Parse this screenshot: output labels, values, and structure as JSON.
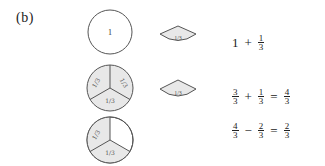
{
  "panel_label": "(b)",
  "rows": [
    {
      "circle": {
        "label": "1",
        "shaded_sectors": [],
        "sector_labels": []
      },
      "wedge": {
        "label": "1/3"
      },
      "equation": {
        "terms": [
          {
            "type": "int",
            "value": "1"
          },
          {
            "type": "op",
            "value": "+"
          },
          {
            "type": "frac",
            "num": "1",
            "den": "3"
          }
        ]
      }
    },
    {
      "circle": {
        "label": "",
        "shaded_sectors": [
          "left",
          "right",
          "bottom"
        ],
        "sector_labels": [
          "1/3",
          "1/3",
          "1/3"
        ]
      },
      "wedge": {
        "label": "1/3"
      },
      "equation": {
        "terms": [
          {
            "type": "frac",
            "num": "3",
            "den": "3"
          },
          {
            "type": "op",
            "value": "+"
          },
          {
            "type": "frac",
            "num": "1",
            "den": "3"
          },
          {
            "type": "op",
            "value": "="
          },
          {
            "type": "frac",
            "num": "4",
            "den": "3"
          }
        ]
      }
    },
    {
      "circle": {
        "label": "",
        "shaded_sectors": [
          "left",
          "bottom"
        ],
        "sector_labels": [
          "1/3",
          "1/3"
        ]
      },
      "wedge": null,
      "equation": {
        "terms": [
          {
            "type": "frac",
            "num": "4",
            "den": "3"
          },
          {
            "type": "op",
            "value": "−"
          },
          {
            "type": "frac",
            "num": "2",
            "den": "3"
          },
          {
            "type": "op",
            "value": "="
          },
          {
            "type": "frac",
            "num": "2",
            "den": "3"
          }
        ]
      }
    }
  ],
  "colors": {
    "stroke": "#555555",
    "shade": "#e8e8e8",
    "text": "#222222",
    "background": "#ffffff"
  }
}
